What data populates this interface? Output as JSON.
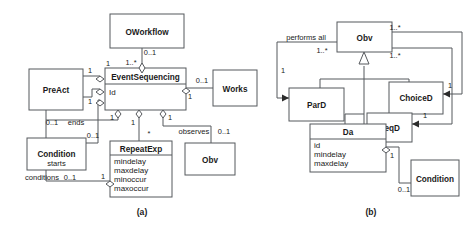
{
  "figure": {
    "captions": [
      {
        "id": "cap-a",
        "label": "(a)"
      },
      {
        "id": "cap-b",
        "label": "(b)"
      }
    ]
  },
  "colors": {
    "stroke": "#55585c",
    "fill": "#ffffff",
    "text": "#1a1a1a",
    "arrow": "#2b2b2b"
  },
  "diagram_a": {
    "classes": [
      {
        "id": "oworkflow",
        "name": "OWorkflow",
        "attributes": []
      },
      {
        "id": "eventsequencing",
        "name": "EventSequencing",
        "attributes": [
          "Id"
        ]
      },
      {
        "id": "preact",
        "name": "PreAct",
        "attributes": []
      },
      {
        "id": "works",
        "name": "Works",
        "attributes": []
      },
      {
        "id": "condition",
        "name": "Condition",
        "attributes": []
      },
      {
        "id": "repeatexp",
        "name": "RepeatExp",
        "attributes": [
          "mindelay",
          "maxdelay",
          "minoccur",
          "maxoccur"
        ]
      },
      {
        "id": "obv",
        "name": "Obv",
        "attributes": []
      }
    ],
    "multiplicities": [
      {
        "id": "a-m1",
        "label": "0..1"
      },
      {
        "id": "a-m2",
        "label": "1..*"
      },
      {
        "id": "a-m3",
        "label": "1"
      },
      {
        "id": "a-m4",
        "label": "1"
      },
      {
        "id": "a-m5",
        "label": "0..1"
      },
      {
        "id": "a-m6",
        "label": "1"
      },
      {
        "id": "a-m7",
        "label": "1"
      },
      {
        "id": "a-m8",
        "label": "0..1"
      },
      {
        "id": "a-m9",
        "label": "0..1"
      },
      {
        "id": "a-m10",
        "label": "1"
      },
      {
        "id": "a-m11",
        "label": "1"
      },
      {
        "id": "a-m12",
        "label": "1"
      },
      {
        "id": "a-m13",
        "label": "*"
      },
      {
        "id": "a-m14",
        "label": "0..1"
      },
      {
        "id": "a-m15",
        "label": "0..1"
      },
      {
        "id": "a-m16",
        "label": "1"
      }
    ],
    "roles": [
      {
        "id": "a-r1",
        "label": "ends"
      },
      {
        "id": "a-r2",
        "label": "starts"
      },
      {
        "id": "a-r3",
        "label": "conditions"
      },
      {
        "id": "a-r4",
        "label": "observes"
      }
    ]
  },
  "diagram_b": {
    "classes": [
      {
        "id": "b-obv",
        "name": "Obv",
        "attributes": []
      },
      {
        "id": "b-pard",
        "name": "ParD",
        "attributes": []
      },
      {
        "id": "b-choiced",
        "name": "ChoiceD",
        "attributes": []
      },
      {
        "id": "b-seqd",
        "name": "SeqD",
        "attributes": []
      },
      {
        "id": "b-da",
        "name": "Da",
        "attributes": [
          "id",
          "mindelay",
          "maxdelay"
        ]
      },
      {
        "id": "b-condition",
        "name": "Condition",
        "attributes": []
      }
    ],
    "multiplicities": [
      {
        "id": "b-m1",
        "label": "1..*"
      },
      {
        "id": "b-m2",
        "label": "1..*"
      },
      {
        "id": "b-m3",
        "label": "1..*"
      },
      {
        "id": "b-m4",
        "label": "1"
      },
      {
        "id": "b-m5",
        "label": "1"
      },
      {
        "id": "b-m6",
        "label": "1"
      },
      {
        "id": "b-m7",
        "label": "1"
      },
      {
        "id": "b-m8",
        "label": "0..1"
      }
    ],
    "roles": [
      {
        "id": "b-r1",
        "label": "performs all"
      }
    ]
  }
}
